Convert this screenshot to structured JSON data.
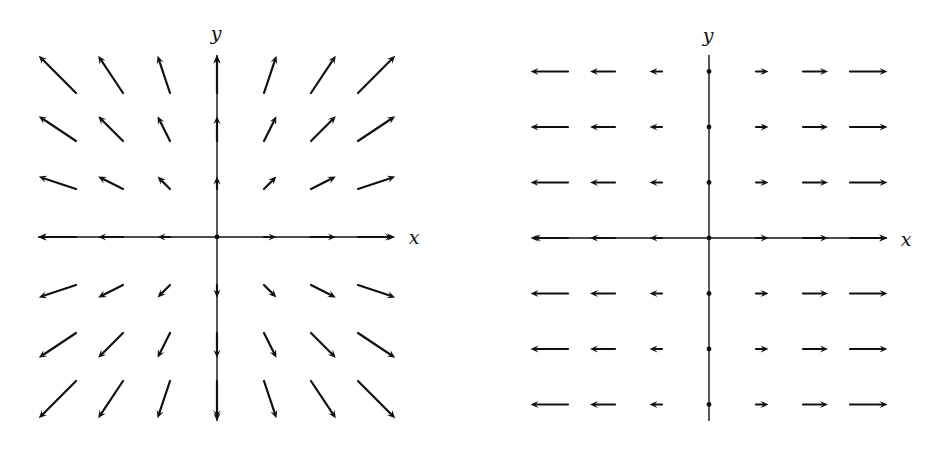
{
  "chart_data": [
    {
      "type": "vector_field",
      "title": "",
      "field": "F(x, y) = (x, y)",
      "description": "Radial vector field pointing outward from the origin",
      "xlabel": "x",
      "ylabel": "y",
      "grid": {
        "x": [
          -3,
          -2,
          -1,
          0,
          1,
          2,
          3
        ],
        "y": [
          -3,
          -2,
          -1,
          0,
          1,
          2,
          3
        ]
      },
      "vectors": "v(i, j) = (i, j) at each grid point (i, j)",
      "axes_arrows_both_ends": true,
      "layout": {
        "origin_px": [
          217,
          237
        ],
        "unit_x_px": 47,
        "unit_y_px": 48,
        "vector_scale_px": 12.4,
        "x_axis_px": [
          38,
          393
        ],
        "y_axis_px": [
          55,
          421
        ],
        "xlabel_pos": [
          414,
          237
        ],
        "ylabel_pos": [
          216,
          33
        ]
      }
    },
    {
      "type": "vector_field",
      "title": "",
      "field": "F(x, y) = (x, 0)",
      "description": "Horizontal vector field pointing away from the y-axis; zero vectors on the y-axis shown as dots",
      "xlabel": "x",
      "ylabel": "y",
      "grid": {
        "x": [
          -3,
          -2,
          -1,
          0,
          1,
          2,
          3
        ],
        "y": [
          -3,
          -2,
          -1,
          0,
          1,
          2,
          3
        ]
      },
      "vectors": "v(i, j) = (i, 0) at each grid point (i, j)",
      "axes_arrows_both_ends": false,
      "x_axis_arrows_both_ends": true,
      "layout": {
        "origin_px": [
          709,
          238
        ],
        "unit_x_px": 47,
        "unit_y_px": 55.5,
        "vector_scale_px": 12.5,
        "x_axis_px": [
          533,
          887
        ],
        "y_axis_px": [
          55,
          421
        ],
        "xlabel_pos": [
          906,
          239
        ],
        "ylabel_pos": [
          708,
          35
        ]
      }
    }
  ],
  "labels": {
    "left": {
      "x": "x",
      "y": "y"
    },
    "right": {
      "x": "x",
      "y": "y"
    }
  },
  "colors": {
    "ink": "#111111",
    "background": "#ffffff"
  }
}
